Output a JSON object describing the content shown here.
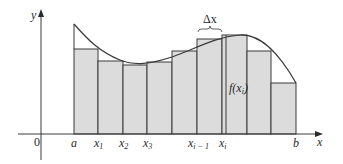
{
  "diagram": {
    "type": "riemann-sum",
    "colors": {
      "rect_fill": "#dcdcdc",
      "rect_stroke": "#3a3a3a",
      "curve": "#3a3a3a",
      "axis": "#3a3a3a",
      "text": "#2a2a2a"
    },
    "axes": {
      "y_label": "y",
      "x_label": "x",
      "origin_label": "0"
    },
    "tick_labels": {
      "a": "a",
      "x1": "x",
      "x1_sub": "1",
      "x2": "x",
      "x2_sub": "2",
      "x3": "x",
      "x3_sub": "3",
      "xim1": "x",
      "xim1_sub": "i − 1",
      "xi": "x",
      "xi_sub": "i",
      "b": "b"
    },
    "annotations": {
      "delta_x": "Δx",
      "f_xi_prefix": "f(",
      "f_xi_var": "x",
      "f_xi_sub": "i",
      "f_xi_suffix": ")"
    },
    "rectangles": [
      {
        "x0": 74,
        "x1": 98,
        "top": 49
      },
      {
        "x0": 98,
        "x1": 123,
        "top": 61
      },
      {
        "x0": 123,
        "x1": 147,
        "top": 65
      },
      {
        "x0": 147,
        "x1": 172,
        "top": 62
      },
      {
        "x0": 172,
        "x1": 197,
        "top": 51
      },
      {
        "x0": 197,
        "x1": 222,
        "top": 39
      },
      {
        "x0": 222,
        "x1": 247,
        "top": 35
      },
      {
        "x0": 247,
        "x1": 271,
        "top": 51
      },
      {
        "x0": 271,
        "x1": 296,
        "top": 83
      }
    ]
  }
}
